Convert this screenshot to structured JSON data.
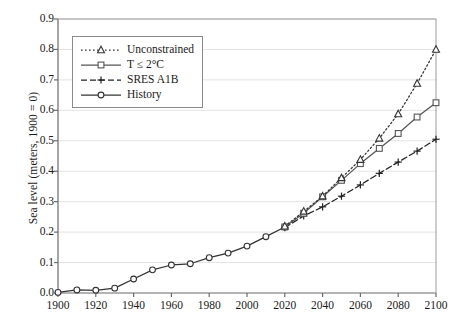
{
  "chart_data": {
    "type": "line",
    "title": "",
    "xlabel": "",
    "ylabel": "Sea level (meters, 1900 = 0)",
    "xlim": [
      1900,
      2100
    ],
    "ylim": [
      0.0,
      0.9
    ],
    "grid": true,
    "legend_position": "upper left inside plot",
    "x_ticks": [
      1900,
      1920,
      1940,
      1960,
      1980,
      2000,
      2020,
      2040,
      2060,
      2080,
      2100
    ],
    "x_tick_labels": [
      "1900",
      "1920",
      "1940",
      "1960",
      "1980",
      "2000",
      "2020",
      "2040",
      "2060",
      "2080",
      "2100"
    ],
    "y_ticks": [
      0.0,
      0.1,
      0.2,
      0.3,
      0.4,
      0.5,
      0.6,
      0.7,
      0.8,
      0.9
    ],
    "y_tick_labels": [
      "0.0",
      "0.1",
      "0.2",
      "0.3",
      "0.4",
      "0.5",
      "0.6",
      "0.7",
      "0.8",
      "0.9"
    ],
    "series": [
      {
        "name": "Unconstrained",
        "marker": "triangle",
        "linestyle": "dotted",
        "color": "#333333",
        "x": [
          2020,
          2030,
          2040,
          2050,
          2060,
          2070,
          2080,
          2090,
          2100
        ],
        "values": [
          0.219,
          0.268,
          0.318,
          0.378,
          0.438,
          0.508,
          0.588,
          0.688,
          0.8
        ]
      },
      {
        "name": "T ≤ 2°C",
        "marker": "square",
        "linestyle": "solid",
        "color": "#555555",
        "x": [
          2020,
          2030,
          2040,
          2050,
          2060,
          2070,
          2080,
          2090,
          2100
        ],
        "values": [
          0.217,
          0.262,
          0.316,
          0.37,
          0.425,
          0.475,
          0.524,
          0.578,
          0.625
        ]
      },
      {
        "name": "SRES A1B",
        "marker": "plus",
        "linestyle": "dashed",
        "color": "#222222",
        "x": [
          2020,
          2030,
          2040,
          2050,
          2060,
          2070,
          2080,
          2090,
          2100
        ],
        "values": [
          0.215,
          0.253,
          0.283,
          0.318,
          0.355,
          0.393,
          0.43,
          0.466,
          0.505
        ]
      },
      {
        "name": "History",
        "marker": "circle",
        "linestyle": "solid",
        "color": "#333333",
        "x": [
          1900,
          1910,
          1920,
          1930,
          1940,
          1950,
          1960,
          1970,
          1980,
          1990,
          2000,
          2010,
          2020
        ],
        "values": [
          0.002,
          0.01,
          0.009,
          0.016,
          0.046,
          0.076,
          0.092,
          0.096,
          0.116,
          0.131,
          0.154,
          0.185,
          0.217
        ]
      }
    ]
  },
  "legend": {
    "entries": [
      {
        "label": "Unconstrained"
      },
      {
        "label": "T ≤ 2°C"
      },
      {
        "label": "SRES A1B"
      },
      {
        "label": "History"
      }
    ]
  }
}
